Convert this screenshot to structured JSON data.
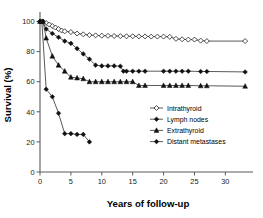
{
  "chart_data": {
    "type": "line",
    "title": "",
    "subtitle": "",
    "xlabel": "Years of follow-up",
    "ylabel": "Survival (%)",
    "xlim": [
      0,
      33.5
    ],
    "ylim": [
      0,
      105
    ],
    "xticks": [
      0,
      5,
      10,
      15,
      20,
      25,
      30
    ],
    "yticks": [
      0,
      20,
      40,
      60,
      80,
      100
    ],
    "xtick_labels": [
      "0",
      "5",
      "10",
      "15",
      "20",
      "25",
      "30"
    ],
    "ytick_labels": [
      "0",
      "20",
      "40",
      "60",
      "80",
      "100"
    ],
    "grid": false,
    "legend_position": "center-right",
    "series": [
      {
        "name": "Intrathyroid",
        "marker": "open-diamond",
        "points": [
          [
            0,
            100
          ],
          [
            0.5,
            100
          ],
          [
            1,
            99
          ],
          [
            1.5,
            98
          ],
          [
            2,
            97
          ],
          [
            2.5,
            96
          ],
          [
            3,
            95
          ],
          [
            3.5,
            94
          ],
          [
            4,
            93.5
          ],
          [
            5,
            93
          ],
          [
            6,
            92
          ],
          [
            7,
            91.5
          ],
          [
            8,
            91
          ],
          [
            9,
            90.8
          ],
          [
            10,
            90.6
          ],
          [
            11,
            90.5
          ],
          [
            12,
            90.4
          ],
          [
            13,
            90.3
          ],
          [
            14,
            90.2
          ],
          [
            15,
            90.2
          ],
          [
            16,
            90.1
          ],
          [
            17,
            90.1
          ],
          [
            18,
            90
          ],
          [
            19,
            90
          ],
          [
            20,
            90
          ],
          [
            21,
            89.8
          ],
          [
            22,
            88.5
          ],
          [
            23,
            88.2
          ],
          [
            24,
            88
          ],
          [
            25,
            88
          ],
          [
            26,
            87.3
          ],
          [
            27,
            87
          ],
          [
            33.2,
            87
          ]
        ]
      },
      {
        "name": "Lymph nodes",
        "marker": "solid-diamond",
        "points": [
          [
            0,
            100
          ],
          [
            0.4,
            100
          ],
          [
            1,
            95
          ],
          [
            2,
            92
          ],
          [
            3,
            89.5
          ],
          [
            4,
            87
          ],
          [
            5,
            85.5
          ],
          [
            6,
            82
          ],
          [
            7,
            78.5
          ],
          [
            8,
            75
          ],
          [
            9,
            71
          ],
          [
            10,
            70.5
          ],
          [
            11,
            70.5
          ],
          [
            12,
            70.5
          ],
          [
            13,
            70.3
          ],
          [
            13.5,
            67
          ],
          [
            14,
            67
          ],
          [
            15,
            67
          ],
          [
            16,
            67
          ],
          [
            17,
            67
          ],
          [
            20,
            67
          ],
          [
            21,
            67
          ],
          [
            22,
            67
          ],
          [
            23,
            67
          ],
          [
            24,
            67
          ],
          [
            26,
            66.8
          ],
          [
            27,
            66.8
          ],
          [
            33.2,
            66.5
          ]
        ]
      },
      {
        "name": "Extrathyroid",
        "marker": "solid-triangle",
        "points": [
          [
            0,
            100
          ],
          [
            0.5,
            100
          ],
          [
            1,
            89
          ],
          [
            2,
            77
          ],
          [
            3,
            71
          ],
          [
            4,
            67
          ],
          [
            5,
            63
          ],
          [
            6,
            62.5
          ],
          [
            7,
            62
          ],
          [
            8,
            60
          ],
          [
            9,
            60
          ],
          [
            10,
            60
          ],
          [
            11,
            60
          ],
          [
            12,
            60
          ],
          [
            13,
            60
          ],
          [
            14,
            60
          ],
          [
            15,
            60
          ],
          [
            16,
            57.5
          ],
          [
            17,
            57.5
          ],
          [
            20,
            57.5
          ],
          [
            21,
            57.5
          ],
          [
            22,
            57.5
          ],
          [
            23,
            57.5
          ],
          [
            24,
            57.5
          ],
          [
            26,
            57.3
          ],
          [
            27,
            57.3
          ],
          [
            33.2,
            57
          ]
        ]
      },
      {
        "name": "Distant metastases",
        "marker": "solid-diamond",
        "points": [
          [
            0,
            100
          ],
          [
            0.3,
            100
          ],
          [
            1,
            55
          ],
          [
            2,
            50
          ],
          [
            3,
            39
          ],
          [
            4,
            25.5
          ],
          [
            5,
            25.5
          ],
          [
            6,
            25
          ],
          [
            7,
            25
          ],
          [
            8,
            20
          ]
        ]
      }
    ],
    "legend": [
      {
        "label": "Intrathyroid",
        "marker": "open-diamond"
      },
      {
        "label": "Lymph nodes",
        "marker": "solid-diamond"
      },
      {
        "label": "Extrathyroid",
        "marker": "solid-triangle"
      },
      {
        "label": "Distant metastases",
        "marker": "solid-diamond"
      }
    ],
    "colors": {
      "line": "#3c3c3c",
      "marker_fill_solid": "#111111",
      "marker_fill_open": "#ffffff",
      "marker_stroke": "#222222",
      "axis": "#5a5a5a",
      "text": "#000000",
      "background": "#ffffff"
    }
  }
}
